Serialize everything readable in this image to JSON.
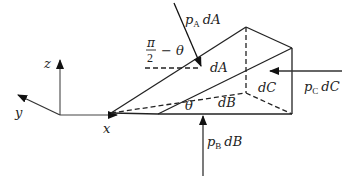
{
  "diagram": {
    "type": "prism-pressure-element",
    "axes": {
      "z": "z",
      "y": "y",
      "x": "x"
    },
    "faces": {
      "A": "dA",
      "B": "dB",
      "C": "dC"
    },
    "angles": {
      "theta": "θ",
      "complement_num": "π",
      "complement_den": "2",
      "complement_rest": "− θ"
    },
    "forces": {
      "A": {
        "p": "p",
        "sub": "A",
        "area": "dA"
      },
      "B": {
        "p": "p",
        "sub": "B",
        "area": "dB"
      },
      "C": {
        "p": "p",
        "sub": "C",
        "area": "dC"
      }
    },
    "colors": {
      "line": "#222222",
      "axis": "#555555"
    }
  }
}
